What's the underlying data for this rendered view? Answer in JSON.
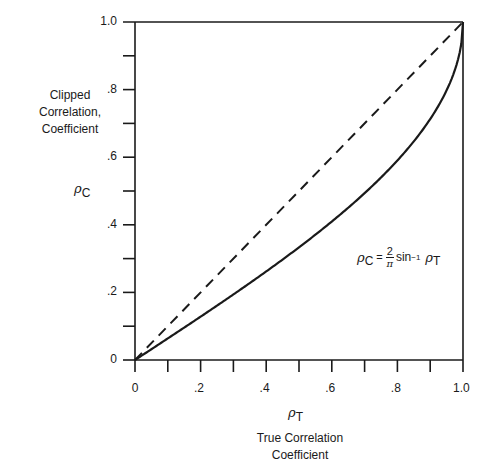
{
  "chart_data": {
    "type": "line",
    "title": "",
    "xlabel_symbol": "ρ",
    "xlabel_symbol_sub": "T",
    "xlabel": "True Correlation Coefficient",
    "xlabel_line1": "True Correlation",
    "xlabel_line2": "Coefficient",
    "ylabel_symbol": "ρ",
    "ylabel_symbol_sub": "C",
    "ylabel_line1": "Clipped",
    "ylabel_line2": "Correlation,",
    "ylabel_line3": "Coefficient",
    "xlim": [
      0,
      1.0
    ],
    "ylim": [
      0,
      1.0
    ],
    "xticks": [
      "0",
      ".2",
      ".4",
      ".6",
      ".8",
      "1.0"
    ],
    "yticks": [
      "0",
      ".2",
      ".4",
      ".6",
      ".8",
      "1.0"
    ],
    "grid": false,
    "annotation": {
      "lhs_symbol": "ρ",
      "lhs_sub": "C",
      "equals": "=",
      "numerator": "2",
      "denominator": "π",
      "func": "sin",
      "func_sup": "−1",
      "rhs_symbol": "ρ",
      "rhs_sub": "T"
    },
    "series": [
      {
        "name": "reference line ρC = ρT",
        "style": "dashed",
        "x": [
          0,
          1.0
        ],
        "y": [
          0,
          1.0
        ]
      },
      {
        "name": "ρC = (2/π) sin⁻¹ ρT",
        "style": "solid",
        "x": [
          0,
          0.1,
          0.2,
          0.3,
          0.4,
          0.5,
          0.6,
          0.7,
          0.8,
          0.9,
          0.95,
          1.0
        ],
        "y": [
          0,
          0.064,
          0.128,
          0.194,
          0.262,
          0.333,
          0.41,
          0.494,
          0.59,
          0.713,
          0.799,
          1.0
        ]
      }
    ]
  }
}
